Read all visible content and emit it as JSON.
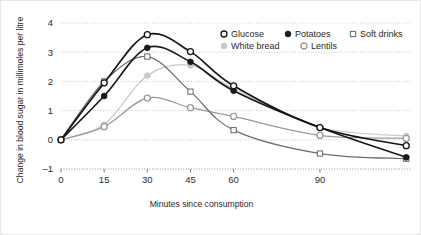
{
  "chart_data": {
    "type": "line",
    "title": "",
    "xlabel": "Minutes since consumption",
    "ylabel": "Change in blood sugar in millimoles per litre",
    "x": [
      0,
      15,
      30,
      45,
      60,
      90,
      120
    ],
    "xticks": [
      "0",
      "15",
      "30",
      "45",
      "60",
      "90"
    ],
    "xtick_values": [
      0,
      15,
      30,
      45,
      60,
      90
    ],
    "yticks": [
      "4",
      "3",
      "2",
      "1",
      "0",
      "-1"
    ],
    "ytick_values": [
      4,
      3,
      2,
      1,
      0,
      -1
    ],
    "xlim": [
      0,
      122
    ],
    "ylim": [
      -1,
      4
    ],
    "grid": true,
    "grid_style": "dotted-horizontal",
    "legend_position": "top-right",
    "series": [
      {
        "name": "Glucose",
        "marker": "open-circle",
        "color": "#141414",
        "marker_fill": "#ffffff",
        "values": [
          0,
          1.95,
          3.6,
          3.02,
          1.85,
          0.42,
          -0.2
        ]
      },
      {
        "name": "Potatoes",
        "marker": "filled-circle",
        "color": "#1a1a1a",
        "marker_fill": "#1a1a1a",
        "values": [
          0,
          1.5,
          3.15,
          2.67,
          1.68,
          0.42,
          -0.6
        ]
      },
      {
        "name": "Soft drinks",
        "marker": "open-square",
        "color": "#6e6e6e",
        "marker_fill": "#ffffff",
        "values": [
          0,
          2.0,
          2.85,
          1.65,
          0.33,
          -0.47,
          -0.65
        ]
      },
      {
        "name": "White bread",
        "marker": "filled-circle",
        "color": "#c9c9c9",
        "marker_fill": "#c9c9c9",
        "values": [
          0,
          0.52,
          2.2,
          2.55,
          1.75,
          0.43,
          0.13
        ]
      },
      {
        "name": "Lentils",
        "marker": "open-circle",
        "color": "#9a9a9a",
        "marker_fill": "#ffffff",
        "values": [
          0,
          0.45,
          1.43,
          1.1,
          0.8,
          0.15,
          0.05
        ]
      }
    ]
  }
}
